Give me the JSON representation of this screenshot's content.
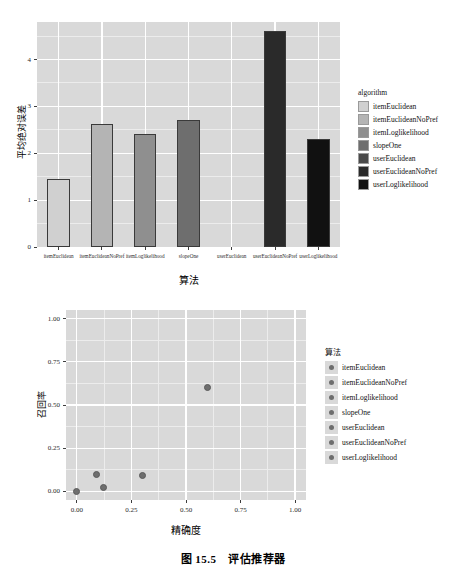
{
  "caption": "图 15.5　评估推荐器",
  "colors": {
    "panel_bg": "#d9d9d9",
    "grid_major": "#ffffff",
    "grid_minor": "#ececec",
    "point": "#6e6e6e",
    "text": "#000000"
  },
  "chart_data": [
    {
      "id": "mae-bar-chart",
      "type": "bar",
      "title": "",
      "xlabel": "算法",
      "ylabel": "平均绝对误差",
      "legend_title": "algorithm",
      "legend_position": "right",
      "grid": true,
      "ylim": [
        0,
        4.8
      ],
      "yticks": [
        "0",
        "1",
        "2",
        "3",
        "4"
      ],
      "ytick_values": [
        0,
        1,
        2,
        3,
        4
      ],
      "categories": [
        "itemEuclidean",
        "itemEuclideanNoPref",
        "itemLoglikelihood",
        "slopeOne",
        "userEuclidean",
        "userEuclideanNoPref",
        "userLoglikelihood"
      ],
      "values": [
        1.45,
        2.62,
        2.42,
        2.7,
        null,
        4.6,
        2.3
      ],
      "bar_colors": [
        "#d0d0d0",
        "#b4b4b4",
        "#8f8f8f",
        "#6e6e6e",
        "#4a4a4a",
        "#2a2a2a",
        "#111111"
      ],
      "legend_entries": [
        "itemEuclidean",
        "itemEuclideanNoPref",
        "itemLoglikelihood",
        "slopeOne",
        "userEuclidean",
        "userEuclideanNoPref",
        "userLoglikelihood"
      ]
    },
    {
      "id": "precision-recall-scatter",
      "type": "scatter",
      "title": "",
      "xlabel": "精确度",
      "ylabel": "召回率",
      "legend_title": "算法",
      "legend_position": "right",
      "grid": true,
      "xlim": [
        -0.05,
        1.05
      ],
      "ylim": [
        -0.05,
        1.05
      ],
      "xticks": [
        "0.00",
        "0.25",
        "0.50",
        "0.75",
        "1.00"
      ],
      "xtick_values": [
        0.0,
        0.25,
        0.5,
        0.75,
        1.0
      ],
      "yticks": [
        "0.00",
        "0.25",
        "0.50",
        "0.75",
        "1.00"
      ],
      "ytick_values": [
        0.0,
        0.25,
        0.5,
        0.75,
        1.0
      ],
      "points": [
        {
          "x": 0.0,
          "y": 0.0,
          "series": "itemEuclidean"
        },
        {
          "x": 0.09,
          "y": 0.1,
          "series": "itemEuclideanNoPref"
        },
        {
          "x": 0.12,
          "y": 0.02,
          "series": "itemLoglikelihood"
        },
        {
          "x": 0.3,
          "y": 0.09,
          "series": "slopeOne"
        },
        {
          "x": 0.6,
          "y": 0.6,
          "series": "userLoglikelihood"
        }
      ],
      "legend_entries": [
        "itemEuclidean",
        "itemEuclideanNoPref",
        "itemLoglikelihood",
        "slopeOne",
        "userEuclidean",
        "userEuclideanNoPref",
        "userLoglikelihood"
      ]
    }
  ]
}
